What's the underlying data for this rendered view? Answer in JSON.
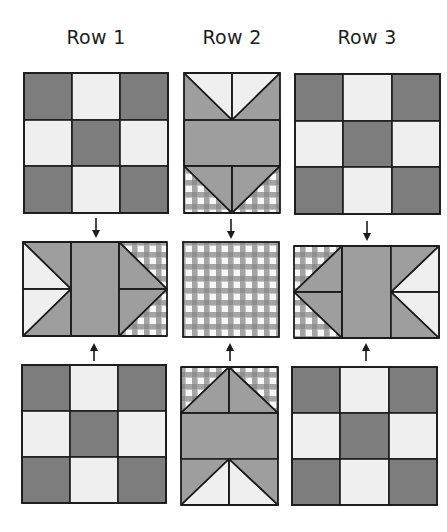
{
  "columns": [
    {
      "label": "Row 1",
      "center_x": 96
    },
    {
      "label": "Row 2",
      "center_x": 232
    },
    {
      "label": "Row 3",
      "center_x": 367
    }
  ],
  "colors": {
    "dark": "#7d7d7d",
    "light": "#efefef",
    "medium": "#9e9e9e",
    "gingham_bg": "#c6c6c6",
    "gingham_band": "#9c9c9c",
    "gingham_white": "#f8f8f8",
    "outline": "#1c1c1c"
  },
  "blocks": {
    "row1_top": {
      "type": "nine-patch",
      "x": 24,
      "y": 73,
      "w": 144,
      "h": 140
    },
    "row2_top": {
      "type": "flying-geese-down",
      "x": 184,
      "y": 73,
      "w": 96,
      "h": 140
    },
    "row3_top": {
      "type": "nine-patch",
      "x": 295,
      "y": 74,
      "w": 145,
      "h": 140
    },
    "row1_middle": {
      "type": "flying-geese-right",
      "x": 23,
      "y": 242,
      "w": 144,
      "h": 94
    },
    "row2_middle": {
      "type": "gingham-square",
      "x": 183,
      "y": 242,
      "w": 96,
      "h": 95
    },
    "row3_middle": {
      "type": "flying-geese-left",
      "x": 294,
      "y": 246,
      "w": 145,
      "h": 92
    },
    "row1_bottom": {
      "type": "nine-patch",
      "x": 22,
      "y": 365,
      "w": 144,
      "h": 138
    },
    "row2_bottom": {
      "type": "flying-geese-up",
      "x": 181,
      "y": 367,
      "w": 97,
      "h": 138
    },
    "row3_bottom": {
      "type": "nine-patch",
      "x": 292,
      "y": 367,
      "w": 145,
      "h": 138
    }
  },
  "arrows": [
    {
      "direction": "down",
      "x": 96,
      "y1": 218,
      "y2": 238
    },
    {
      "direction": "up",
      "x": 94,
      "y1": 361,
      "y2": 343
    },
    {
      "direction": "down",
      "x": 231,
      "y1": 219,
      "y2": 239
    },
    {
      "direction": "up",
      "x": 230,
      "y1": 361,
      "y2": 343
    },
    {
      "direction": "down",
      "x": 367,
      "y1": 221,
      "y2": 241
    },
    {
      "direction": "up",
      "x": 366,
      "y1": 361,
      "y2": 343
    }
  ]
}
